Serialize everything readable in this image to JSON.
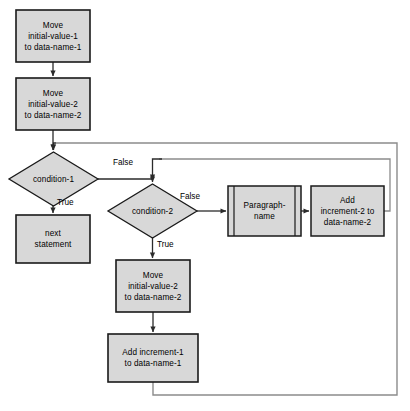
{
  "diagram": {
    "style": {
      "node_fill": "#d8d8d8",
      "node_stroke": "#1a1a1a",
      "line_color": "#2b2b2b",
      "frame_color": "#8c8c8c",
      "background": "#ffffff"
    },
    "nodes": [
      {
        "id": "move-1",
        "shape": "process",
        "lines": [
          "Move",
          "initial-value-1",
          "to data-name-1"
        ],
        "x": 16,
        "y": 10,
        "w": 74,
        "h": 52
      },
      {
        "id": "move-2",
        "shape": "process",
        "lines": [
          "Move",
          "initial-value-2",
          "to data-name-2"
        ],
        "x": 16,
        "y": 78,
        "w": 74,
        "h": 52
      },
      {
        "id": "condition-1",
        "shape": "decision",
        "lines": [
          "condition-1"
        ],
        "x": 9,
        "y": 152,
        "w": 89,
        "h": 54
      },
      {
        "id": "next-statement",
        "shape": "process",
        "lines": [
          "next",
          "statement"
        ],
        "x": 16,
        "y": 215,
        "w": 74,
        "h": 48
      },
      {
        "id": "condition-2",
        "shape": "decision",
        "lines": [
          "condition-2"
        ],
        "x": 108,
        "y": 184,
        "w": 89,
        "h": 54
      },
      {
        "id": "paragraph-name",
        "shape": "predefined-process",
        "lines": [
          "Paragraph-",
          "name"
        ],
        "x": 228,
        "y": 186,
        "w": 73,
        "h": 50
      },
      {
        "id": "add-increment-2",
        "shape": "process",
        "lines": [
          "Add",
          "increment-2 to",
          "data-name-2"
        ],
        "x": 311,
        "y": 186,
        "w": 73,
        "h": 50
      },
      {
        "id": "move-2b",
        "shape": "process",
        "lines": [
          "Move",
          "initial-value-2",
          "to data-name-2"
        ],
        "x": 116,
        "y": 260,
        "w": 74,
        "h": 52
      },
      {
        "id": "add-increment-1",
        "shape": "process",
        "lines": [
          "Add increment-1",
          "to data-name-1"
        ],
        "x": 108,
        "y": 334,
        "w": 90,
        "h": 48
      }
    ],
    "edge_labels": [
      {
        "id": "cond1-false",
        "text": "False",
        "x": 113,
        "y": 158
      },
      {
        "id": "cond1-true",
        "text": "True",
        "x": 57,
        "y": 198
      },
      {
        "id": "cond2-false",
        "text": "False",
        "x": 180,
        "y": 194
      },
      {
        "id": "cond2-true",
        "text": "True",
        "x": 157,
        "y": 240
      }
    ],
    "connectors": [
      {
        "id": "move1-to-move2",
        "kind": "arrow-down"
      },
      {
        "id": "move2-to-condition1",
        "kind": "arrow-down"
      },
      {
        "id": "condition1-false-to-condition2",
        "kind": "elbow-arrow"
      },
      {
        "id": "condition1-true-to-next-statement",
        "kind": "arrow-down"
      },
      {
        "id": "condition2-false-to-paragraph-name",
        "kind": "arrow-right"
      },
      {
        "id": "paragraph-name-to-add-increment-2",
        "kind": "arrow-right"
      },
      {
        "id": "add-increment-2-feedback-to-condition2",
        "kind": "elbow-arrow"
      },
      {
        "id": "condition2-true-to-move2b",
        "kind": "arrow-down"
      },
      {
        "id": "move2b-to-add-increment-1",
        "kind": "arrow-down"
      },
      {
        "id": "add-increment-1-feedback-to-condition1",
        "kind": "elbow-arrow"
      }
    ]
  }
}
